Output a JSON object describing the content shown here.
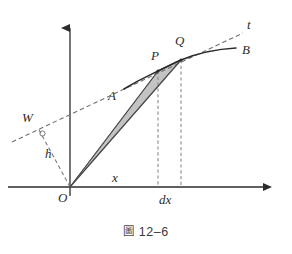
{
  "figure": {
    "caption_symbol": "圖",
    "caption_number": "12–6",
    "background_color": "#ffffff",
    "ink_color": "#2b2b2b",
    "dash_color": "#7a7a7a",
    "shade_fill": "#b9b9b9",
    "shade_stroke": "#6e6e6e"
  },
  "axes": {
    "origin": {
      "x": 70,
      "y": 187
    },
    "x_axis": {
      "x1": 8,
      "y1": 187,
      "x2": 268,
      "y2": 187,
      "arrow": "right"
    },
    "y_axis": {
      "x1": 70,
      "y1": 196,
      "x2": 70,
      "y2": 22,
      "arrow": "up"
    },
    "origin_label": "O",
    "x_label": "x",
    "x_label_pos": {
      "x": 113,
      "y": 182
    },
    "origin_label_pos": {
      "x": 60,
      "y": 200
    }
  },
  "curve": {
    "name": "AB",
    "start_label": "A",
    "end_label": "B",
    "start_label_pos": {
      "x": 110,
      "y": 98
    },
    "end_label_pos": {
      "x": 243,
      "y": 53
    },
    "path": "M 124,89 C 140,79 150,75 158,71 C 168,66 174,63 181,60 C 198,53 218,49 236,48"
  },
  "tangent": {
    "name": "t",
    "label": "t",
    "label_pos": {
      "x": 248,
      "y": 28
    },
    "line": {
      "x1": 12,
      "y1": 142,
      "x2": 243,
      "y2": 33
    },
    "touch_point": "Q"
  },
  "points": [
    {
      "id": "P",
      "label": "P",
      "x": 158,
      "y": 71,
      "label_pos": {
        "x": 152,
        "y": 60
      }
    },
    {
      "id": "Q",
      "label": "Q",
      "x": 181,
      "y": 60,
      "label_pos": {
        "x": 176,
        "y": 45
      }
    },
    {
      "id": "W",
      "label": "W",
      "x": 38,
      "y": 128,
      "label_pos": {
        "x": 26,
        "y": 122
      }
    },
    {
      "id": "O",
      "label": "O",
      "x": 70,
      "y": 187,
      "label_pos": {
        "x": 60,
        "y": 200
      }
    }
  ],
  "perpendicular": {
    "label": "h",
    "label_pos": {
      "x": 47,
      "y": 156
    },
    "line": {
      "x1": 70,
      "y1": 187,
      "x2": 38,
      "y2": 128
    },
    "right_angle_marker": {
      "cx": 42,
      "cy": 133,
      "r": 2.4
    }
  },
  "shaded_triangle": {
    "name": "OPQ",
    "vertices": [
      {
        "x": 70,
        "y": 187
      },
      {
        "x": 158,
        "y": 71
      },
      {
        "x": 181,
        "y": 60
      }
    ]
  },
  "chords": [
    {
      "name": "OP",
      "x1": 70,
      "y1": 187,
      "x2": 158,
      "y2": 71
    },
    {
      "name": "OQ",
      "x1": 70,
      "y1": 187,
      "x2": 181,
      "y2": 60
    },
    {
      "name": "PQ",
      "x1": 158,
      "y1": 71,
      "x2": 181,
      "y2": 60
    }
  ],
  "drop_lines": [
    {
      "name": "P-foot",
      "x": 158,
      "y1": 71,
      "y2": 187
    },
    {
      "name": "Q-foot",
      "x": 181,
      "y1": 60,
      "y2": 187
    }
  ],
  "interval": {
    "label": "dx",
    "label_pos": {
      "x": 162,
      "y": 202
    },
    "from_x": 158,
    "to_x": 181
  }
}
